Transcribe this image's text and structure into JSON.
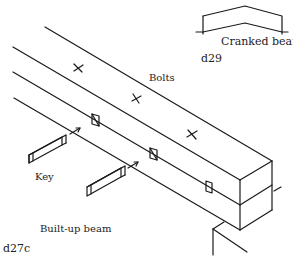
{
  "figures": {
    "built_up_beam": {
      "id_label": "d27c",
      "caption": "Built-up beam",
      "labels": {
        "bolts": "Bolts",
        "key": "Key"
      }
    },
    "cranked_beam": {
      "id_label": "d29",
      "caption": "Cranked beam"
    }
  },
  "colors": {
    "ink": "#1a1a1a",
    "background": "#ffffff"
  }
}
